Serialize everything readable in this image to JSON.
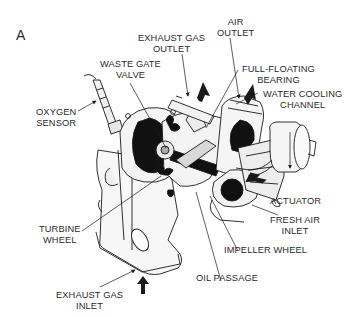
{
  "figure": {
    "panel_letter": "A",
    "colors": {
      "ink": "#1a1a1a",
      "paper": "#ffffff",
      "text": "#2a2a2a"
    }
  },
  "labels": {
    "exhaust_gas_outlet": {
      "line1": "EXHAUST GAS",
      "line2": "OUTLET"
    },
    "air_outlet": {
      "line1": "AIR",
      "line2": "OUTLET"
    },
    "waste_gate_valve": {
      "line1": "WASTE GATE",
      "line2": "VALVE"
    },
    "full_floating_bearing": {
      "line1": "FULL-FLOATING",
      "line2": "BEARING"
    },
    "water_cooling_channel": {
      "line1": "WATER COOLING",
      "line2": "CHANNEL"
    },
    "oxygen_sensor": {
      "line1": "OXYGEN",
      "line2": "SENSOR"
    },
    "actuator": {
      "line1": "ACTUATOR"
    },
    "turbine_wheel": {
      "line1": "TURBINE",
      "line2": "WHEEL"
    },
    "fresh_air_inlet": {
      "line1": "FRESH AIR",
      "line2": "INLET"
    },
    "impeller_wheel": {
      "line1": "IMPELLER WHEEL"
    },
    "oil_passage": {
      "line1": "OIL PASSAGE"
    },
    "exhaust_gas_inlet": {
      "line1": "EXHAUST GAS",
      "line2": "INLET"
    }
  }
}
